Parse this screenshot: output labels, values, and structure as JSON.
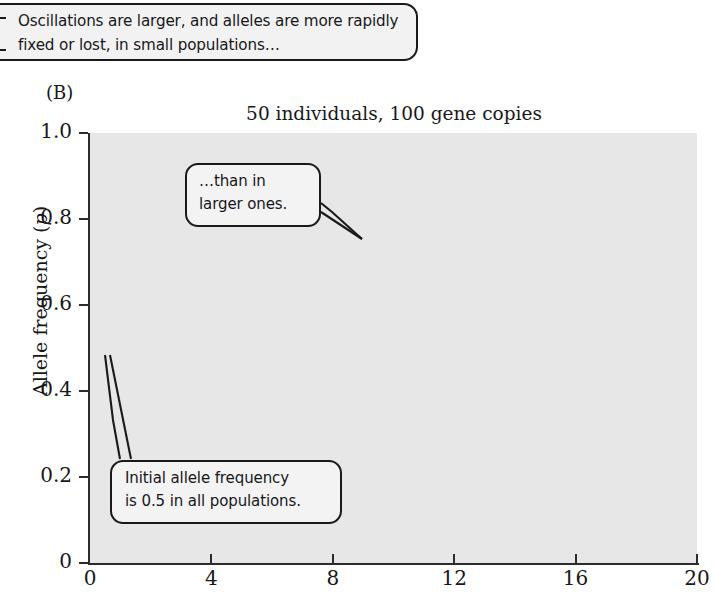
{
  "caption": {
    "text": "Oscillations are larger, and alleles are more rapidly fixed or lost, in small populations…"
  },
  "panel": {
    "label": "(B)"
  },
  "chart_data": {
    "type": "line",
    "title": "50 individuals, 100 gene copies",
    "xlabel": "",
    "ylabel": "Allele frequency (p)",
    "xlim": [
      0,
      20
    ],
    "ylim": [
      0,
      1.0
    ],
    "xticks": [
      0,
      4,
      8,
      12,
      16,
      20
    ],
    "xtick_labels": [
      "0",
      "4",
      "8",
      "12",
      "16",
      "20"
    ],
    "yticks": [
      0,
      0.2,
      0.4,
      0.6,
      0.8,
      1.0
    ],
    "ytick_labels": [
      "0",
      "0.2",
      "0.4",
      "0.6",
      "0.8",
      "1.0"
    ],
    "grid": true,
    "grid_color": "#ffffff",
    "plot_bg": "#e7e7e7",
    "line_color": "#2b2b2b",
    "legend": null,
    "x": [
      0,
      1,
      2,
      3,
      4,
      5,
      6,
      7,
      8,
      9,
      10,
      11,
      12,
      13,
      14,
      15,
      16,
      17,
      18,
      19,
      20
    ],
    "series": [
      {
        "name": "pop-1",
        "values": [
          0.5,
          0.57,
          0.6,
          0.63,
          0.67,
          0.69,
          0.68,
          0.68,
          0.69,
          0.73,
          0.75,
          0.78,
          0.8,
          0.8,
          0.83,
          0.82,
          0.86,
          0.86,
          0.84,
          0.89,
          0.94
        ]
      },
      {
        "name": "pop-2",
        "values": [
          0.5,
          0.54,
          0.55,
          0.57,
          0.58,
          0.6,
          0.62,
          0.63,
          0.66,
          0.68,
          0.72,
          0.74,
          0.72,
          0.76,
          0.79,
          0.77,
          0.8,
          0.8,
          0.82,
          0.86,
          0.88
        ]
      },
      {
        "name": "pop-3",
        "values": [
          0.5,
          0.52,
          0.54,
          0.53,
          0.56,
          0.58,
          0.57,
          0.61,
          0.63,
          0.62,
          0.66,
          0.7,
          0.69,
          0.72,
          0.7,
          0.74,
          0.76,
          0.73,
          0.78,
          0.82,
          0.86
        ]
      },
      {
        "name": "pop-4",
        "values": [
          0.5,
          0.56,
          0.53,
          0.55,
          0.54,
          0.57,
          0.6,
          0.62,
          0.64,
          0.63,
          0.65,
          0.64,
          0.67,
          0.66,
          0.7,
          0.72,
          0.71,
          0.69,
          0.72,
          0.76,
          0.79
        ]
      },
      {
        "name": "pop-5",
        "values": [
          0.5,
          0.48,
          0.51,
          0.53,
          0.52,
          0.55,
          0.54,
          0.57,
          0.6,
          0.62,
          0.61,
          0.64,
          0.66,
          0.68,
          0.65,
          0.67,
          0.69,
          0.72,
          0.7,
          0.68,
          0.71
        ]
      },
      {
        "name": "pop-6",
        "values": [
          0.5,
          0.53,
          0.56,
          0.54,
          0.57,
          0.56,
          0.59,
          0.58,
          0.61,
          0.6,
          0.63,
          0.62,
          0.65,
          0.63,
          0.66,
          0.64,
          0.67,
          0.66,
          0.69,
          0.68,
          0.7
        ]
      },
      {
        "name": "pop-7",
        "values": [
          0.5,
          0.51,
          0.49,
          0.52,
          0.54,
          0.53,
          0.56,
          0.55,
          0.58,
          0.57,
          0.6,
          0.59,
          0.62,
          0.61,
          0.64,
          0.66,
          0.63,
          0.65,
          0.64,
          0.66,
          0.67
        ]
      },
      {
        "name": "pop-8",
        "values": [
          0.5,
          0.55,
          0.52,
          0.56,
          0.55,
          0.58,
          0.57,
          0.6,
          0.58,
          0.61,
          0.59,
          0.62,
          0.6,
          0.63,
          0.61,
          0.63,
          0.62,
          0.64,
          0.63,
          0.65,
          0.64
        ]
      },
      {
        "name": "pop-9",
        "values": [
          0.5,
          0.47,
          0.5,
          0.48,
          0.51,
          0.5,
          0.53,
          0.52,
          0.55,
          0.54,
          0.57,
          0.56,
          0.58,
          0.57,
          0.6,
          0.59,
          0.61,
          0.6,
          0.62,
          0.61,
          0.63
        ]
      },
      {
        "name": "pop-10",
        "values": [
          0.5,
          0.52,
          0.5,
          0.53,
          0.51,
          0.54,
          0.52,
          0.55,
          0.53,
          0.56,
          0.54,
          0.57,
          0.55,
          0.58,
          0.56,
          0.59,
          0.57,
          0.6,
          0.58,
          0.6,
          0.62
        ]
      },
      {
        "name": "pop-11",
        "values": [
          0.5,
          0.49,
          0.47,
          0.5,
          0.48,
          0.51,
          0.49,
          0.52,
          0.5,
          0.53,
          0.51,
          0.54,
          0.52,
          0.55,
          0.53,
          0.56,
          0.54,
          0.57,
          0.56,
          0.58,
          0.6
        ]
      },
      {
        "name": "pop-12",
        "values": [
          0.5,
          0.53,
          0.51,
          0.49,
          0.52,
          0.48,
          0.51,
          0.49,
          0.52,
          0.5,
          0.53,
          0.51,
          0.54,
          0.52,
          0.55,
          0.53,
          0.56,
          0.55,
          0.57,
          0.56,
          0.58
        ]
      },
      {
        "name": "pop-13",
        "values": [
          0.5,
          0.46,
          0.49,
          0.47,
          0.5,
          0.52,
          0.49,
          0.51,
          0.48,
          0.51,
          0.49,
          0.52,
          0.5,
          0.53,
          0.51,
          0.54,
          0.52,
          0.54,
          0.53,
          0.55,
          0.57
        ]
      },
      {
        "name": "pop-14",
        "values": [
          0.5,
          0.51,
          0.48,
          0.46,
          0.49,
          0.47,
          0.5,
          0.48,
          0.51,
          0.49,
          0.52,
          0.5,
          0.52,
          0.51,
          0.53,
          0.52,
          0.54,
          0.53,
          0.55,
          0.54,
          0.56
        ]
      },
      {
        "name": "pop-15",
        "values": [
          0.5,
          0.45,
          0.47,
          0.5,
          0.48,
          0.5,
          0.47,
          0.5,
          0.47,
          0.5,
          0.48,
          0.51,
          0.49,
          0.51,
          0.5,
          0.52,
          0.51,
          0.53,
          0.52,
          0.54,
          0.53
        ]
      },
      {
        "name": "pop-16",
        "values": [
          0.5,
          0.48,
          0.45,
          0.48,
          0.46,
          0.49,
          0.46,
          0.49,
          0.46,
          0.48,
          0.47,
          0.49,
          0.48,
          0.5,
          0.49,
          0.51,
          0.5,
          0.52,
          0.51,
          0.53,
          0.52
        ]
      },
      {
        "name": "pop-17",
        "values": [
          0.5,
          0.47,
          0.44,
          0.46,
          0.44,
          0.47,
          0.45,
          0.47,
          0.45,
          0.47,
          0.46,
          0.48,
          0.47,
          0.49,
          0.48,
          0.5,
          0.49,
          0.51,
          0.5,
          0.5,
          0.51
        ]
      },
      {
        "name": "pop-18",
        "values": [
          0.5,
          0.44,
          0.42,
          0.45,
          0.43,
          0.45,
          0.43,
          0.45,
          0.44,
          0.46,
          0.45,
          0.46,
          0.45,
          0.47,
          0.46,
          0.48,
          0.47,
          0.49,
          0.48,
          0.49,
          0.5
        ]
      },
      {
        "name": "pop-19",
        "values": [
          0.5,
          0.45,
          0.42,
          0.4,
          0.43,
          0.41,
          0.44,
          0.42,
          0.45,
          0.43,
          0.46,
          0.44,
          0.46,
          0.45,
          0.47,
          0.46,
          0.47,
          0.46,
          0.47,
          0.46,
          0.48
        ]
      },
      {
        "name": "pop-20",
        "values": [
          0.5,
          0.42,
          0.4,
          0.43,
          0.41,
          0.43,
          0.42,
          0.44,
          0.43,
          0.45,
          0.44,
          0.45,
          0.44,
          0.46,
          0.45,
          0.45,
          0.44,
          0.45,
          0.44,
          0.45,
          0.44
        ]
      },
      {
        "name": "pop-21",
        "values": [
          0.5,
          0.43,
          0.41,
          0.38,
          0.4,
          0.42,
          0.4,
          0.42,
          0.41,
          0.43,
          0.42,
          0.43,
          0.42,
          0.44,
          0.43,
          0.44,
          0.43,
          0.44,
          0.42,
          0.43,
          0.42
        ]
      },
      {
        "name": "pop-22",
        "values": [
          0.5,
          0.41,
          0.38,
          0.36,
          0.38,
          0.4,
          0.38,
          0.4,
          0.39,
          0.41,
          0.4,
          0.42,
          0.41,
          0.42,
          0.41,
          0.43,
          0.42,
          0.43,
          0.41,
          0.42,
          0.4
        ]
      },
      {
        "name": "pop-23",
        "values": [
          0.5,
          0.46,
          0.43,
          0.4,
          0.37,
          0.35,
          0.34,
          0.36,
          0.35,
          0.38,
          0.37,
          0.39,
          0.38,
          0.4,
          0.39,
          0.41,
          0.4,
          0.42,
          0.41,
          0.4,
          0.38
        ]
      },
      {
        "name": "pop-24",
        "values": [
          0.5,
          0.44,
          0.39,
          0.36,
          0.34,
          0.33,
          0.35,
          0.33,
          0.35,
          0.34,
          0.36,
          0.35,
          0.37,
          0.36,
          0.38,
          0.37,
          0.39,
          0.38,
          0.37,
          0.36,
          0.35
        ]
      },
      {
        "name": "pop-25",
        "values": [
          0.5,
          0.4,
          0.37,
          0.34,
          0.33,
          0.32,
          0.31,
          0.33,
          0.32,
          0.34,
          0.33,
          0.35,
          0.34,
          0.33,
          0.35,
          0.34,
          0.36,
          0.35,
          0.33,
          0.31,
          0.3
        ]
      },
      {
        "name": "pop-26",
        "values": [
          0.5,
          0.38,
          0.34,
          0.32,
          0.31,
          0.3,
          0.32,
          0.31,
          0.33,
          0.32,
          0.31,
          0.33,
          0.32,
          0.34,
          0.33,
          0.35,
          0.36,
          0.33,
          0.3,
          0.27,
          0.24
        ]
      }
    ]
  },
  "annotations": [
    {
      "id": "callout-larger",
      "line1": "…than in",
      "line2": "larger ones."
    },
    {
      "id": "callout-initial",
      "line1": "Initial allele frequency",
      "line2": "is 0.5 in all populations."
    }
  ]
}
